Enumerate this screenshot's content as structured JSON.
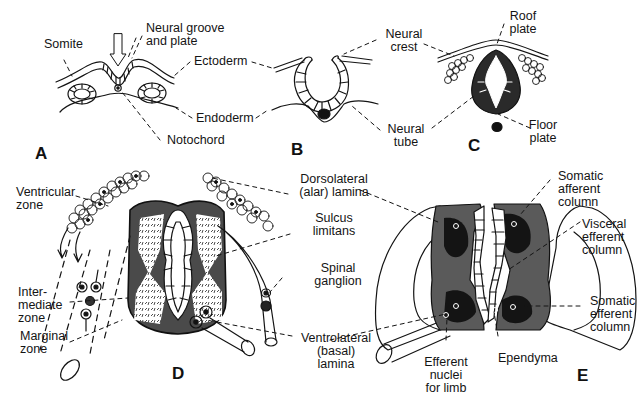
{
  "figure": {
    "panels": [
      {
        "id": "A",
        "letter": "A",
        "labels": [
          "Somite",
          "Neural groove and plate",
          "Ectoderm",
          "Endoderm",
          "Notochord"
        ]
      },
      {
        "id": "B",
        "letter": "B",
        "labels": [
          "Neural crest",
          "Neural tube"
        ]
      },
      {
        "id": "C",
        "letter": "C",
        "labels": [
          "Roof plate",
          "Floor plate"
        ]
      },
      {
        "id": "D",
        "letter": "D",
        "labels": [
          "Ventricular zone",
          "Intermediate zone",
          "Marginal zone",
          "Dorsolateral (alar) lamina",
          "Sulcus limitans",
          "Spinal ganglion",
          "Ventrolateral (basal) lamina"
        ]
      },
      {
        "id": "E",
        "letter": "E",
        "labels": [
          "Somatic afferent column",
          "Visceral efferent column",
          "Somatic efferent column",
          "Efferent nuclei for limb",
          "Ependyma"
        ]
      }
    ]
  },
  "labels": {
    "somite": "Somite",
    "neural_groove_1": "Neural groove",
    "neural_groove_2": "and plate",
    "ectoderm": "Ectoderm",
    "endoderm": "Endoderm",
    "notochord": "Notochord",
    "neural_crest_1": "Neural",
    "neural_crest_2": "crest",
    "neural_tube_1": "Neural",
    "neural_tube_2": "tube",
    "roof_plate_1": "Roof",
    "roof_plate_2": "plate",
    "floor_plate_1": "Floor",
    "floor_plate_2": "plate",
    "ventricular_1": "Ventricular",
    "ventricular_2": "zone",
    "intermediate_1": "Inter-",
    "intermediate_2": "mediate",
    "intermediate_3": "zone",
    "marginal_1": "Marginal",
    "marginal_2": "zone",
    "dorsolateral_1": "Dorsolateral",
    "dorsolateral_2": "(alar) lamina",
    "sulcus_1": "Sulcus",
    "sulcus_2": "limitans",
    "spinal_ganglion_1": "Spinal",
    "spinal_ganglion_2": "ganglion",
    "ventrolateral_1": "Ventrolateral",
    "ventrolateral_2": "(basal)",
    "ventrolateral_3": "lamina",
    "somatic_afferent_1": "Somatic",
    "somatic_afferent_2": "afferent",
    "somatic_afferent_3": "column",
    "visceral_efferent_1": "Visceral",
    "visceral_efferent_2": "efferent",
    "visceral_efferent_3": "column",
    "somatic_efferent_1": "Somatic",
    "somatic_efferent_2": "efferent",
    "somatic_efferent_3": "column",
    "efferent_nuclei_1": "Efferent",
    "efferent_nuclei_2": "nuclei",
    "efferent_nuclei_3": "for limb",
    "ependyma": "Ependyma"
  },
  "panel_letters": {
    "a": "A",
    "b": "B",
    "c": "C",
    "d": "D",
    "e": "E"
  },
  "colors": {
    "ink": "#141414",
    "dark_fill": "#1c1c1c",
    "mid_fill": "#5a5a5a",
    "paper": "#ffffff"
  }
}
